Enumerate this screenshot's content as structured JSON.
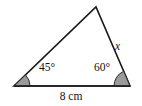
{
  "figure": {
    "kind": "triangle-diagram",
    "background_color": "#ffffff",
    "stroke_color": "#1a1a1a",
    "fill_color": "#ffffff",
    "angle_marker_fill": "#9a9a9a",
    "angle_marker_stroke": "#2b2b2b",
    "stroke_width": 1.6,
    "vertices": {
      "left": {
        "x": 14,
        "y": 86
      },
      "right": {
        "x": 130,
        "y": 86
      },
      "apex": {
        "x": 96,
        "y": 7
      }
    },
    "angle_markers": [
      {
        "at": "left",
        "radius": 16,
        "degrees": 45
      },
      {
        "at": "right",
        "radius": 16,
        "degrees": 60
      }
    ]
  },
  "labels": {
    "angle_left": "45°",
    "angle_right": "60°",
    "side_right": "x",
    "base": "8 cm"
  },
  "geometry_data": {
    "type": "triangle",
    "base_length": "8 cm",
    "known_angles": [
      45,
      60
    ],
    "unknown_side": "x",
    "unknown_side_position": "right"
  }
}
